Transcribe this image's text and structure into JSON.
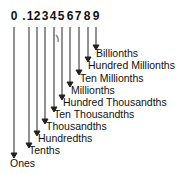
{
  "diagram": {
    "digits": [
      "0",
      ".",
      "1",
      "2",
      "3",
      "4",
      "5",
      "6",
      "7",
      "8",
      "9"
    ],
    "labels": [
      {
        "text": "Billionths",
        "digit": "9"
      },
      {
        "text": "Hundred Millionths",
        "digit": "8"
      },
      {
        "text": "Ten Millionths",
        "digit": "7"
      },
      {
        "text": "Millionths",
        "digit": "6"
      },
      {
        "text": "Hundred Thousandths",
        "digit": "5"
      },
      {
        "text": "Ten Thousandths",
        "digit": "4"
      },
      {
        "text": "Thousandths",
        "digit": "3"
      },
      {
        "text": "Hundredths",
        "digit": "2"
      },
      {
        "text": "Tenths",
        "digit": "1"
      },
      {
        "text": "Ones",
        "digit": "0"
      }
    ],
    "line_color": "#222222"
  }
}
